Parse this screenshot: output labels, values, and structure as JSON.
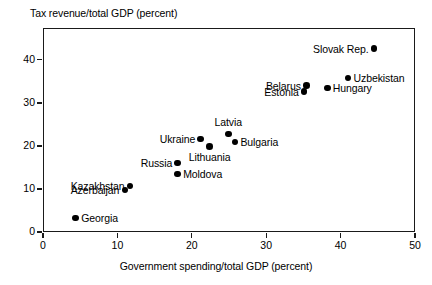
{
  "chart_data": {
    "type": "scatter",
    "title": "",
    "xlabel": "Government spending/total GDP (percent)",
    "ylabel": "Tax revenue/total GDP (percent)",
    "xlim": [
      0,
      50
    ],
    "ylim": [
      0,
      47.4
    ],
    "xticks": [
      0,
      10,
      20,
      30,
      40,
      50
    ],
    "yticks": [
      0,
      10,
      20,
      30,
      40
    ],
    "xtick_labels": [
      "0",
      "10",
      "20",
      "30",
      "40",
      "50"
    ],
    "ytick_labels": [
      "0",
      "10",
      "20",
      "30",
      "40"
    ],
    "grid": false,
    "legend": "none",
    "marker_color": "#000000",
    "frame_color": "#1a1a1a",
    "points": [
      {
        "label": "Georgia",
        "x": 4.4,
        "y": 3.3,
        "label_pos": "right"
      },
      {
        "label": "Azerbaijan",
        "x": 11.0,
        "y": 9.8,
        "label_pos": "left"
      },
      {
        "label": "Kazakhstan",
        "x": 11.7,
        "y": 10.7,
        "label_pos": "left"
      },
      {
        "label": "Moldova",
        "x": 18.1,
        "y": 13.5,
        "label_pos": "right"
      },
      {
        "label": "Russia",
        "x": 18.1,
        "y": 16.0,
        "label_pos": "left"
      },
      {
        "label": "Ukraine",
        "x": 21.2,
        "y": 21.6,
        "label_pos": "left"
      },
      {
        "label": "Lithuania",
        "x": 22.4,
        "y": 19.8,
        "label_pos": "below"
      },
      {
        "label": "Latvia",
        "x": 24.9,
        "y": 22.8,
        "label_pos": "above"
      },
      {
        "label": "Bulgaria",
        "x": 25.8,
        "y": 20.9,
        "label_pos": "right"
      },
      {
        "label": "Estonia",
        "x": 35.1,
        "y": 32.6,
        "label_pos": "left"
      },
      {
        "label": "Belarus",
        "x": 35.4,
        "y": 34.0,
        "label_pos": "left"
      },
      {
        "label": "Hungary",
        "x": 38.2,
        "y": 33.5,
        "label_pos": "right"
      },
      {
        "label": "Uzbekistan",
        "x": 41.0,
        "y": 35.8,
        "label_pos": "right"
      },
      {
        "label": "Slovak Rep.",
        "x": 44.5,
        "y": 42.6,
        "label_pos": "left"
      }
    ]
  }
}
